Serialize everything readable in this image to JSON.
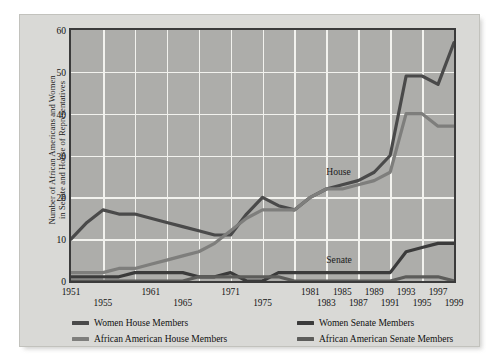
{
  "chart_data": {
    "type": "line",
    "title": "",
    "xlabel": "",
    "ylabel": "Number of African Americans and Women in Senate and House of Representatives",
    "ylabel_line1": "Number of African Americans and Women",
    "ylabel_line2": "in Senate and House of Representatives",
    "ylim": [
      0,
      60
    ],
    "yticks": [
      0,
      10,
      20,
      30,
      40,
      50,
      60
    ],
    "xlim": [
      1951,
      1999
    ],
    "x": [
      1951,
      1953,
      1955,
      1957,
      1959,
      1961,
      1963,
      1965,
      1967,
      1969,
      1971,
      1973,
      1975,
      1977,
      1979,
      1981,
      1983,
      1985,
      1987,
      1989,
      1991,
      1993,
      1995,
      1997,
      1999
    ],
    "xticks": [
      1951,
      1955,
      1961,
      1965,
      1971,
      1975,
      1981,
      1983,
      1985,
      1987,
      1989,
      1991,
      1993,
      1995,
      1997,
      1999
    ],
    "xticks_row_a": [
      1951,
      1961,
      1971,
      1981,
      1985,
      1989,
      1993,
      1997
    ],
    "xticks_row_b": [
      1955,
      1965,
      1975,
      1983,
      1987,
      1991,
      1995,
      1999
    ],
    "grid": true,
    "grid_color": "#f2f2ee",
    "plot_background": "#adadaa",
    "legend_position": "bottom",
    "annotations": [
      {
        "text": "House",
        "x": 1985,
        "y": 26
      },
      {
        "text": "Senate",
        "x": 1985,
        "y": 5
      }
    ],
    "series": [
      {
        "name": "Women House Members",
        "color": "#4a4a4a",
        "values": [
          10,
          14,
          17,
          16,
          16,
          15,
          14,
          13,
          12,
          11,
          11,
          16,
          20,
          18,
          17,
          20,
          22,
          23,
          24,
          26,
          30,
          49,
          49,
          47,
          57
        ]
      },
      {
        "name": "African American House Members",
        "color": "#7e7e7c",
        "values": [
          2,
          2,
          2,
          3,
          3,
          4,
          5,
          6,
          7,
          9,
          12,
          15,
          17,
          17,
          17,
          20,
          22,
          22,
          23,
          24,
          26,
          40,
          40,
          37,
          37
        ]
      },
      {
        "name": "Women Senate Members",
        "color": "#3b3b3b",
        "values": [
          1,
          1,
          1,
          1,
          2,
          2,
          2,
          2,
          1,
          1,
          2,
          0,
          0,
          2,
          2,
          2,
          2,
          2,
          2,
          2,
          2,
          7,
          8,
          9,
          9
        ]
      },
      {
        "name": "African American Senate Members",
        "color": "#5c5c5a",
        "values": [
          0,
          0,
          0,
          0,
          0,
          0,
          0,
          0,
          1,
          1,
          1,
          1,
          1,
          1,
          0,
          0,
          0,
          0,
          0,
          0,
          0,
          1,
          1,
          1,
          0
        ]
      }
    ]
  },
  "legend": {
    "entries": [
      {
        "label": "Women House Members",
        "color": "#4a4a4a"
      },
      {
        "label": "Women Senate Members",
        "color": "#3b3b3b"
      },
      {
        "label": "African American House Members",
        "color": "#7e7e7c"
      },
      {
        "label": "African American Senate Members",
        "color": "#5c5c5a"
      }
    ]
  }
}
